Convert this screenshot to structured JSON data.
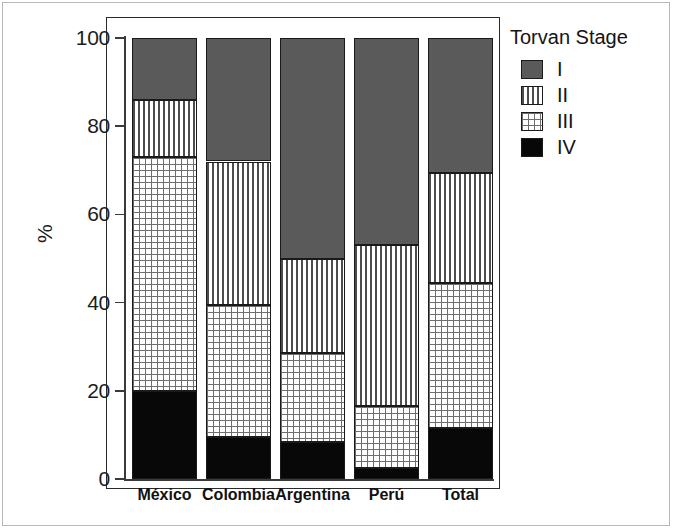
{
  "figure": {
    "y_axis_title": "%",
    "legend_title": "Torvan Stage"
  },
  "chart_data": {
    "type": "bar",
    "variant": "stacked-percent",
    "title": "",
    "subtitle": "",
    "xlabel": "",
    "ylabel": "%",
    "ylim": [
      0,
      100
    ],
    "yticks": [
      0,
      20,
      40,
      60,
      80,
      100
    ],
    "ytick_labels": [
      "0",
      "20",
      "40",
      "60",
      "80",
      "100"
    ],
    "grid": false,
    "legend_title": "Torvan Stage",
    "legend_position": "right",
    "categories": [
      "México",
      "Colombia",
      "Argentina",
      "Perú",
      "Total"
    ],
    "series": [
      {
        "name": "I",
        "pattern": "solid-dark-gray",
        "color": "#5a5a5a",
        "values": [
          14.0,
          28.0,
          50.0,
          47.0,
          30.5
        ]
      },
      {
        "name": "II",
        "pattern": "vertical-lines",
        "color": "#4d4d4d",
        "values": [
          13.0,
          32.5,
          21.5,
          36.5,
          25.0
        ]
      },
      {
        "name": "III",
        "pattern": "dotted-grid",
        "color": "#6e6e6e",
        "values": [
          53.0,
          30.0,
          20.0,
          14.0,
          33.0
        ]
      },
      {
        "name": "IV",
        "pattern": "solid-black",
        "color": "#080808",
        "values": [
          20.0,
          9.5,
          8.5,
          2.5,
          11.5
        ]
      }
    ],
    "stack_order_bottom_to_top": [
      "IV",
      "III",
      "II",
      "I"
    ],
    "cumulative_boundaries_percent": {
      "México": [
        20.0,
        73.0,
        86.0,
        100.0
      ],
      "Colombia": [
        9.5,
        39.5,
        72.0,
        100.0
      ],
      "Argentina": [
        8.5,
        28.5,
        50.0,
        100.0
      ],
      "Perú": [
        2.5,
        16.5,
        53.0,
        100.0
      ],
      "Total": [
        11.5,
        44.5,
        69.5,
        100.0
      ]
    }
  },
  "legend": {
    "title": "Torvan Stage",
    "items": [
      {
        "label": "I",
        "pattern": "solid-dark-gray"
      },
      {
        "label": "II",
        "pattern": "vertical-lines"
      },
      {
        "label": "III",
        "pattern": "dotted-grid"
      },
      {
        "label": "IV",
        "pattern": "solid-black"
      }
    ]
  },
  "colors": {
    "stage_I": "#5a5a5a",
    "stage_II_lines": "#4d4d4d",
    "stage_III_dots": "#6e6e6e",
    "stage_IV": "#080808",
    "axis": "#3a3a3a",
    "panel_border": "#2a2a2a",
    "figure_border": "#b9b9b9",
    "background": "#ffffff"
  }
}
